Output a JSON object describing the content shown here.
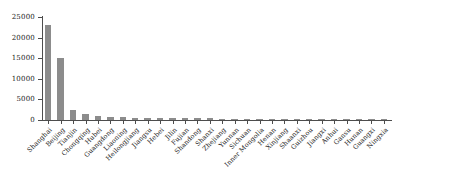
{
  "chart_data": {
    "type": "bar",
    "title": "",
    "xlabel": "",
    "ylabel": "",
    "ylim": [
      0,
      25000
    ],
    "ytick_labels": [
      "25000",
      "20000",
      "15000",
      "10000",
      "5000",
      "0"
    ],
    "ytick_values": [
      25000,
      20000,
      15000,
      10000,
      5000,
      0
    ],
    "grid": false,
    "legend": "none",
    "bar_color": "#8c8c8c",
    "axis_color": "#4d4d4d",
    "categories": [
      "Shanghai",
      "Beijing",
      "Tianjin",
      "Chongqing",
      "Hubei",
      "Guangdong",
      "Liaoning",
      "Heilongjiang",
      "Jiangsu",
      "Hebei",
      "Jilin",
      "Fujian",
      "Shandong",
      "Shanxi",
      "Zhejiang",
      "Yunnan",
      "Sichuan",
      "Inner Mongolia",
      "Henan",
      "Xinjiang",
      "Shaanxi",
      "Guizhou",
      "Jiangxi",
      "Anhui",
      "Gansu",
      "Hunan",
      "Guangxi",
      "Ningxia"
    ],
    "values": [
      23000,
      15000,
      2400,
      1500,
      900,
      700,
      620,
      560,
      500,
      470,
      440,
      420,
      400,
      380,
      360,
      345,
      330,
      320,
      310,
      300,
      290,
      280,
      270,
      260,
      250,
      240,
      230,
      200
    ]
  }
}
